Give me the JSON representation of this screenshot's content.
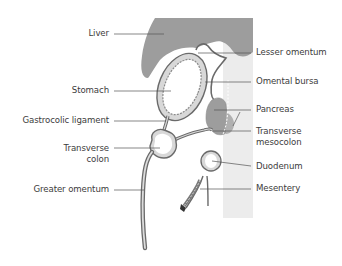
{
  "diagram": {
    "type": "anatomical-sagittal-section",
    "colors": {
      "organ_fill": "#9d9d9d",
      "posterior_wall": "#e9e9e9",
      "membrane_stroke": "#6a6a6a",
      "membrane_fill": "#d8d8d8",
      "leader_line": "#555555",
      "text": "#3c3c3c"
    },
    "labels_left": [
      {
        "id": "liver",
        "text": "Liver"
      },
      {
        "id": "stomach",
        "text": "Stomach"
      },
      {
        "id": "gastrocolic-ligament",
        "text": "Gastrocolic ligament"
      },
      {
        "id": "transverse-colon",
        "line1": "Transverse",
        "line2": "colon"
      },
      {
        "id": "greater-omentum",
        "text": "Greater omentum"
      }
    ],
    "labels_right": [
      {
        "id": "lesser-omentum",
        "text": "Lesser omentum"
      },
      {
        "id": "omental-bursa",
        "text": "Omental bursa"
      },
      {
        "id": "pancreas",
        "text": "Pancreas"
      },
      {
        "id": "transverse-mesocolon",
        "line1": "Transverse",
        "line2": "mesocolon"
      },
      {
        "id": "duodenum",
        "text": "Duodenum"
      },
      {
        "id": "mesentery",
        "text": "Mesentery"
      }
    ]
  }
}
